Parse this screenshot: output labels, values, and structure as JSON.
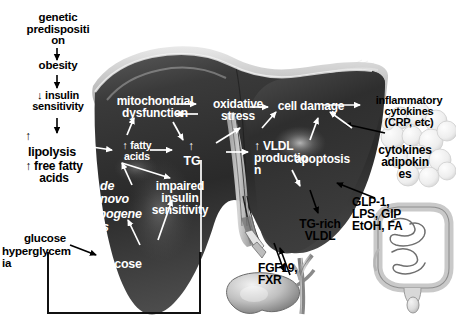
{
  "figure": {
    "type": "biomedical-pathway-diagram",
    "background_color": "#ffffff",
    "text_colors": {
      "on_white": "#000000",
      "on_liver": "#ffffff"
    }
  },
  "labels": {
    "genetic_predisposition": "genetic\npredispositi\non",
    "obesity": "obesity",
    "insulin_sensitivity_down": "↓ insulin\nsensitivity",
    "lipolysis_up": "↑",
    "lipolysis": "lipolysis",
    "free_fatty_acids": "↑ free fatty\nacids",
    "glucose_left": "glucose",
    "hyperglycemia": "hyperglycem\nia",
    "mitochondrial_dysfunction": "mitochondrial\ndysfunction",
    "oxidative_stress": "oxidative\nstress",
    "cell_damage": "cell damage",
    "inflammatory_cytokines": "inflammatory\ncytokines\n(CRP, etc)",
    "cytokines_adipokines": "cytokines\nadipokin\nes",
    "fatty_acids_liver": "↑ fatty\nacids",
    "tg_arrow": "↑",
    "tg": "TG",
    "de_novo_lipogenesis_arrow": "↑",
    "de_novo": "de\nnovo",
    "lipogenesis": "lipogene\nsis",
    "impaired_insulin_sensitivity": "impaired\ninsulin\nsensitivity",
    "glucose_liver_arrow": "↑",
    "glucose_liver": "glucose",
    "vldl_production": "↑ VLDL\nproductio\nn",
    "apoptosis": "apoptosis",
    "tg_rich_vldl": "TG-rich\nVLDL",
    "fgf19_fxr": "FGF19,\nFXR",
    "gut_hormones": "GLP-1,\nLPS,  GIP\nEtOH, FA"
  },
  "organs": {
    "liver": "liver",
    "gallbladder": "gallbladder",
    "bile_duct": "bile-duct",
    "intestine": "intestine",
    "adipose_tissue": "adipose-tissue"
  },
  "annotations": {
    "callout_box": "glucose-hyperglycemia-box"
  }
}
